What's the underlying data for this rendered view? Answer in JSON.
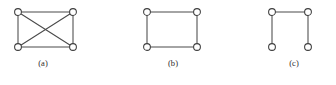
{
  "figure": {
    "background_color": "#ffffff",
    "stroke_color": "#4a4a4a",
    "node_fill_color": "#ffffff",
    "node_stroke_color": "#3d3d3d",
    "label_color": "#2b2b2b",
    "width": 336,
    "height": 85
  },
  "chart_data": {
    "type": "diagram",
    "subtype": "graph-theory-node-link",
    "title": "",
    "panels": [
      {
        "label": "(a)",
        "name": "complete-graph-k4",
        "origin_x": 4,
        "panel_width": 78,
        "node_radius": 3.4,
        "vertex_count": 4,
        "edge_count": 6,
        "nodes": [
          {
            "id": "a-tl",
            "name": "top-left",
            "x": 14,
            "y": 12
          },
          {
            "id": "a-tr",
            "name": "top-right",
            "x": 69,
            "y": 12
          },
          {
            "id": "a-bl",
            "name": "bottom-left",
            "x": 14,
            "y": 47
          },
          {
            "id": "a-br",
            "name": "bottom-right",
            "x": 69,
            "y": 47
          }
        ],
        "edges": [
          {
            "from": "a-tl",
            "to": "a-tr",
            "name": "top-edge"
          },
          {
            "from": "a-tl",
            "to": "a-bl",
            "name": "left-edge"
          },
          {
            "from": "a-tr",
            "to": "a-br",
            "name": "right-edge"
          },
          {
            "from": "a-bl",
            "to": "a-br",
            "name": "bottom-edge"
          },
          {
            "from": "a-tl",
            "to": "a-br",
            "name": "diagonal-tl-br"
          },
          {
            "from": "a-tr",
            "to": "a-bl",
            "name": "diagonal-tr-bl"
          }
        ]
      },
      {
        "label": "(b)",
        "name": "cycle-graph-c4",
        "origin_x": 138,
        "panel_width": 70,
        "node_radius": 3.4,
        "vertex_count": 4,
        "edge_count": 4,
        "nodes": [
          {
            "id": "b-tl",
            "name": "top-left",
            "x": 9,
            "y": 12
          },
          {
            "id": "b-tr",
            "name": "top-right",
            "x": 59,
            "y": 12
          },
          {
            "id": "b-bl",
            "name": "bottom-left",
            "x": 9,
            "y": 47
          },
          {
            "id": "b-br",
            "name": "bottom-right",
            "x": 59,
            "y": 47
          }
        ],
        "edges": [
          {
            "from": "b-tl",
            "to": "b-tr",
            "name": "top-edge"
          },
          {
            "from": "b-tl",
            "to": "b-bl",
            "name": "left-edge"
          },
          {
            "from": "b-tr",
            "to": "b-br",
            "name": "right-edge"
          },
          {
            "from": "b-bl",
            "to": "b-br",
            "name": "bottom-edge"
          }
        ]
      },
      {
        "label": "(c)",
        "name": "path-graph-p4",
        "origin_x": 258,
        "panel_width": 72,
        "node_radius": 3.4,
        "vertex_count": 4,
        "edge_count": 3,
        "nodes": [
          {
            "id": "c-tl",
            "name": "top-left",
            "x": 14,
            "y": 12
          },
          {
            "id": "c-tr",
            "name": "top-right",
            "x": 50,
            "y": 12
          },
          {
            "id": "c-bl",
            "name": "bottom-left",
            "x": 14,
            "y": 47
          },
          {
            "id": "c-br",
            "name": "bottom-right",
            "x": 50,
            "y": 47
          }
        ],
        "edges": [
          {
            "from": "c-tl",
            "to": "c-tr",
            "name": "top-edge"
          },
          {
            "from": "c-tl",
            "to": "c-bl",
            "name": "left-edge"
          },
          {
            "from": "c-tr",
            "to": "c-br",
            "name": "right-edge"
          }
        ]
      }
    ]
  }
}
